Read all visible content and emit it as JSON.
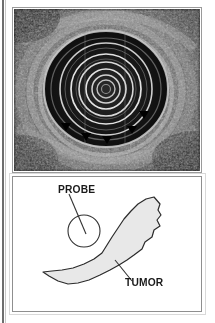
{
  "figure": {
    "name": "endoscopic-ultrasound-with-schematic",
    "panels": [
      {
        "id": "ultrasound",
        "type": "grayscale-ultrasound-image",
        "description": "Radial endoscopic ultrasound cross-section showing concentric transducer rings in a hypoechoic lumen surrounded by speckled gut-wall tissue; small black arrowheads mark the lower tumor margin."
      },
      {
        "id": "schematic",
        "type": "line-drawing",
        "description": "Line schematic of the same cross-section: an open circle marks the probe and a shaded crescent marks the tumor."
      }
    ]
  },
  "labels": {
    "probe": "PROBE",
    "tumor": "TUMOR"
  },
  "colors": {
    "tumor_fill": "#e8e8e8",
    "tumor_stroke": "#2b2b2b",
    "probe_stroke": "#333333",
    "label_text": "#1a1a1a",
    "panel_border": "#9a9a9a",
    "ultrasound_background": "#111111",
    "arrowhead": "#000000"
  },
  "schematic_geometry": {
    "probe_circle": {
      "cx": 71,
      "cy": 54,
      "r": 16
    },
    "probe_leader": {
      "x1": 56,
      "y1": 18,
      "x2": 73,
      "y2": 56
    },
    "tumor_leader": {
      "x1": 120,
      "y1": 105,
      "x2": 103,
      "y2": 84
    },
    "tumor_outline_points": "143,21 148,30 146,41 141,48 144,56 138,62 137,70 128,78 121,84 113,90 104,94 95,99 83,104 72,107 60,107 50,103 42,98 35,94 46,92 58,90 70,86 82,80 90,73 96,64 103,55 111,45 119,36 127,29 135,23",
    "tumor_arrowhead_count": 5
  },
  "ultrasound_geometry": {
    "ring_center": {
      "cx": 92,
      "cy": 80
    },
    "ring_radii": [
      9,
      14,
      20,
      27,
      35,
      46,
      60
    ],
    "lumen_radius": 62,
    "arrowheads": [
      {
        "x": 52,
        "y": 118
      },
      {
        "x": 72,
        "y": 128
      },
      {
        "x": 93,
        "y": 131
      },
      {
        "x": 118,
        "y": 121
      },
      {
        "x": 130,
        "y": 106
      }
    ]
  }
}
